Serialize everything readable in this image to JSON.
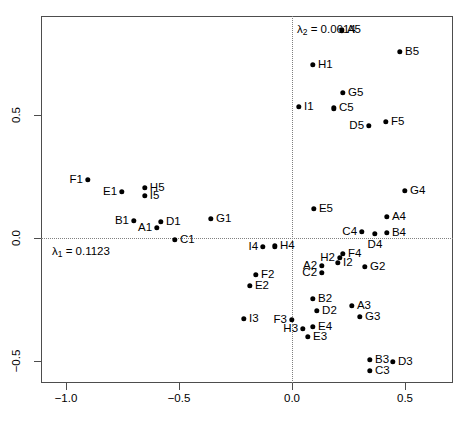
{
  "chart_data": {
    "type": "scatter",
    "title": "",
    "xlabel": "",
    "ylabel": "",
    "xlim": [
      -1.112,
      0.712
    ],
    "ylim": [
      -0.672,
      0.82
    ],
    "grid": false,
    "reference_lines": [
      {
        "axis": "horizontal",
        "value": 0.0,
        "style": "dotted"
      },
      {
        "axis": "vertical",
        "value": 0.0,
        "style": "dotted"
      }
    ],
    "xticks": [
      -1.0,
      -0.5,
      0.0,
      0.5
    ],
    "xticklabels": [
      "-1.0",
      "-0.5",
      "0.0",
      "0.5"
    ],
    "yticks": [
      -0.5,
      0.0,
      0.5
    ],
    "yticklabels": [
      "-0.5",
      "0.0",
      "0.5"
    ],
    "legend": null,
    "annotations": [
      {
        "text": "λ",
        "sub": "2",
        "rest": "= 0.0614",
        "x": 0.022,
        "y": 0.845,
        "name": "lambda2-annotation"
      },
      {
        "text": "λ",
        "sub": "1",
        "rest": "= 0.1123",
        "x": -1.062,
        "y": -0.057,
        "name": "lambda1-annotation"
      }
    ],
    "point_labels_note": "Each point is labelled with its row code (letter + number).",
    "points": [
      {
        "label": "A5",
        "x": 0.221,
        "y": 0.845,
        "lpos": "r"
      },
      {
        "label": "B5",
        "x": 0.478,
        "y": 0.756,
        "lpos": "r"
      },
      {
        "label": "H1",
        "x": 0.093,
        "y": 0.703,
        "lpos": "r"
      },
      {
        "label": "G5",
        "x": 0.226,
        "y": 0.589,
        "lpos": "r"
      },
      {
        "label": "I1",
        "x": 0.031,
        "y": 0.533,
        "lpos": "r"
      },
      {
        "label": "C5",
        "x": 0.186,
        "y": 0.528,
        "lpos": "r"
      },
      {
        "label": "D5",
        "x": 0.341,
        "y": 0.455,
        "lpos": "l"
      },
      {
        "label": "F5",
        "x": 0.416,
        "y": 0.472,
        "lpos": "r"
      },
      {
        "label": "G4",
        "x": 0.5,
        "y": 0.191,
        "lpos": "r"
      },
      {
        "label": "F1",
        "x": -0.903,
        "y": 0.236,
        "lpos": "l"
      },
      {
        "label": "H5",
        "x": -0.651,
        "y": 0.203,
        "lpos": "r"
      },
      {
        "label": "E1",
        "x": -0.752,
        "y": 0.187,
        "lpos": "l"
      },
      {
        "label": "I5",
        "x": -0.651,
        "y": 0.171,
        "lpos": "r"
      },
      {
        "label": "E5",
        "x": 0.097,
        "y": 0.118,
        "lpos": "r"
      },
      {
        "label": "A4",
        "x": 0.42,
        "y": 0.085,
        "lpos": "r"
      },
      {
        "label": "B1",
        "x": -0.699,
        "y": 0.069,
        "lpos": "l"
      },
      {
        "label": "D1",
        "x": -0.58,
        "y": 0.065,
        "lpos": "r"
      },
      {
        "label": "G1",
        "x": -0.358,
        "y": 0.077,
        "lpos": "r"
      },
      {
        "label": "C4",
        "x": 0.31,
        "y": 0.024,
        "lpos": "l"
      },
      {
        "label": "B4",
        "x": 0.42,
        "y": 0.02,
        "lpos": "r"
      },
      {
        "label": "A1",
        "x": -0.597,
        "y": 0.041,
        "lpos": "l"
      },
      {
        "label": "D4",
        "x": 0.367,
        "y": 0.016,
        "lpos": "b"
      },
      {
        "label": "C1",
        "x": -0.518,
        "y": -0.008,
        "lpos": "r"
      },
      {
        "label": "I4",
        "x": -0.128,
        "y": -0.037,
        "lpos": "l"
      },
      {
        "label": "H4",
        "x": -0.075,
        "y": -0.033,
        "lpos": "r"
      },
      {
        "label": "F4",
        "x": 0.226,
        "y": -0.065,
        "lpos": "r"
      },
      {
        "label": "H2",
        "x": 0.212,
        "y": -0.081,
        "lpos": "l"
      },
      {
        "label": "I2",
        "x": 0.204,
        "y": -0.102,
        "lpos": "r"
      },
      {
        "label": "A2",
        "x": 0.133,
        "y": -0.114,
        "lpos": "l"
      },
      {
        "label": "G2",
        "x": 0.323,
        "y": -0.118,
        "lpos": "r"
      },
      {
        "label": "C2",
        "x": 0.133,
        "y": -0.142,
        "lpos": "l"
      },
      {
        "label": "F2",
        "x": -0.159,
        "y": -0.15,
        "lpos": "r"
      },
      {
        "label": "E2",
        "x": -0.186,
        "y": -0.195,
        "lpos": "r"
      },
      {
        "label": "B2",
        "x": 0.093,
        "y": -0.248,
        "lpos": "r"
      },
      {
        "label": "A3",
        "x": 0.265,
        "y": -0.276,
        "lpos": "r"
      },
      {
        "label": "D2",
        "x": 0.111,
        "y": -0.297,
        "lpos": "r"
      },
      {
        "label": "G3",
        "x": 0.301,
        "y": -0.321,
        "lpos": "r"
      },
      {
        "label": "I3",
        "x": -0.212,
        "y": -0.329,
        "lpos": "r"
      },
      {
        "label": "F3",
        "x": -0.0,
        "y": -0.333,
        "lpos": "l"
      },
      {
        "label": "E4",
        "x": 0.093,
        "y": -0.362,
        "lpos": "r"
      },
      {
        "label": "H3",
        "x": 0.049,
        "y": -0.37,
        "lpos": "l"
      },
      {
        "label": "E3",
        "x": 0.071,
        "y": -0.402,
        "lpos": "r"
      },
      {
        "label": "B3",
        "x": 0.345,
        "y": -0.496,
        "lpos": "r"
      },
      {
        "label": "D3",
        "x": 0.447,
        "y": -0.504,
        "lpos": "r"
      },
      {
        "label": "C3",
        "x": 0.345,
        "y": -0.541,
        "lpos": "r"
      }
    ]
  }
}
